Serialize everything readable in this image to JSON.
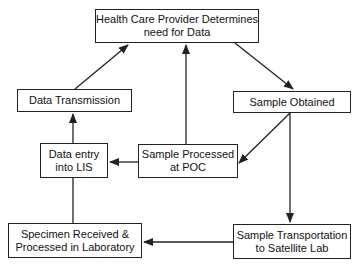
{
  "diagram": {
    "type": "flowchart",
    "nodes": {
      "provider": {
        "line1": "Health Care Provider Determines",
        "line2": "need for Data"
      },
      "sample_obtained": {
        "line1": "Sample Obtained"
      },
      "sample_poc": {
        "line1": "Sample Processed",
        "line2": "at POC"
      },
      "transport": {
        "line1": "Sample Transportation",
        "line2": "to Satellite Lab"
      },
      "specimen": {
        "line1": "Specimen Received &",
        "line2": "Processed in Laboratory"
      },
      "lis": {
        "line1": "Data entry",
        "line2": "into LIS"
      },
      "transmission": {
        "line1": "Data Transmission"
      }
    },
    "edges": [
      {
        "from": "provider",
        "to": "sample_obtained"
      },
      {
        "from": "sample_obtained",
        "to": "sample_poc"
      },
      {
        "from": "sample_obtained",
        "to": "transport"
      },
      {
        "from": "sample_poc",
        "to": "provider"
      },
      {
        "from": "sample_poc",
        "to": "lis"
      },
      {
        "from": "transport",
        "to": "specimen"
      },
      {
        "from": "specimen",
        "to": "lis"
      },
      {
        "from": "lis",
        "to": "transmission"
      },
      {
        "from": "transmission",
        "to": "provider"
      }
    ],
    "colors": {
      "line": "#222222",
      "background": "#ffffff"
    }
  }
}
